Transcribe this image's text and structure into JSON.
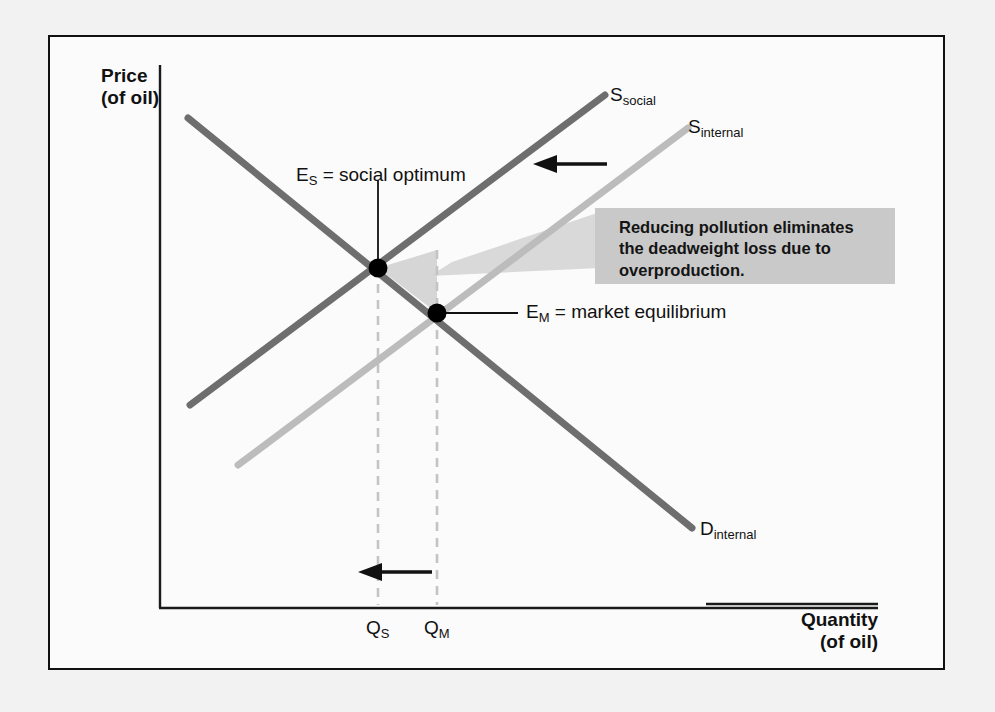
{
  "figure": {
    "type": "economics-supply-demand-diagram",
    "frame_background": "#fbfbfb",
    "page_background": "#f2f2f2"
  },
  "axes": {
    "y_title_line1": "Price",
    "y_title_line2": "(of oil)",
    "x_title_line1": "Quantity",
    "x_title_line2": "(of oil)",
    "axis_color": "#1a1a1a"
  },
  "curves": [
    {
      "id": "demand",
      "label_main": "D",
      "label_sub": "internal",
      "color": "#6e6e6e",
      "x1": 188,
      "y1": 118,
      "x2": 692,
      "y2": 528,
      "label_x": 700,
      "label_y": 518
    },
    {
      "id": "supply-social",
      "label_main": "S",
      "label_sub": "social",
      "color": "#6e6e6e",
      "x1": 190,
      "y1": 405,
      "x2": 605,
      "y2": 95,
      "label_x": 610,
      "label_y": 84
    },
    {
      "id": "supply-internal",
      "label_main": "S",
      "label_sub": "internal",
      "color": "#bcbcbc",
      "x1": 238,
      "y1": 465,
      "x2": 688,
      "y2": 128,
      "label_x": 688,
      "label_y": 116
    }
  ],
  "points": [
    {
      "id": "social-optimum",
      "x": 378,
      "y": 268,
      "label_main": "E",
      "label_sub": "S",
      "label_rest": " = social optimum",
      "label_x": 296,
      "label_y": 164,
      "leader": {
        "x1": 378,
        "y1": 180,
        "x2": 378,
        "y2": 264
      }
    },
    {
      "id": "market-equilibrium",
      "x": 437,
      "y": 313,
      "label_main": "E",
      "label_sub": "M",
      "label_rest": " = market equilibrium",
      "label_x": 526,
      "label_y": 300,
      "leader": {
        "x1": 443,
        "y1": 313,
        "x2": 518,
        "y2": 313
      }
    }
  ],
  "quantity_markers": [
    {
      "id": "q-social",
      "label_main": "Q",
      "label_sub": "S",
      "x": 378,
      "label_x": 366,
      "label_y": 618
    },
    {
      "id": "q-market",
      "label_main": "Q",
      "label_sub": "M",
      "x": 437,
      "label_x": 424,
      "label_y": 618
    }
  ],
  "deadweight_loss_region": {
    "fill": "#d6d6d6",
    "points": "378,268 437,313 437,250"
  },
  "callout": {
    "text": "Reducing pollution eliminates\nthe deadweight loss due to\noverproduction.",
    "background": "#c9c9c9",
    "tail_fill": "#d2d2d2"
  },
  "arrows": [
    {
      "id": "supply-shift-arrow",
      "from_x": 607,
      "from_y": 164,
      "to_x": 533,
      "to_y": 164,
      "color": "#111111"
    },
    {
      "id": "quantity-shift-arrow",
      "from_x": 432,
      "from_y": 572,
      "to_x": 358,
      "to_y": 572,
      "color": "#111111"
    }
  ],
  "colors": {
    "dark_curve": "#6e6e6e",
    "light_curve": "#bcbcbc",
    "dashed_guide": "#c4c4c4",
    "point_fill": "#000000",
    "text": "#111111"
  }
}
